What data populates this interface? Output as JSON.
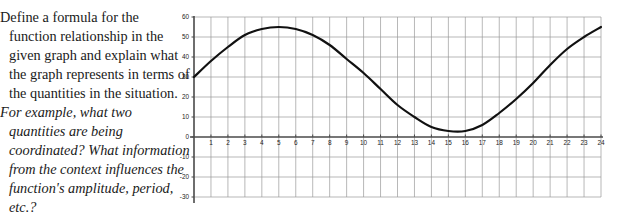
{
  "prompt": {
    "roman_text": "Define a formula for the function relationship in the given graph and explain what the graph represents in terms of the quantities in the situation.",
    "italic_text": "For example, what two quantities are being coordinated? What information from the context influences the function's amplitude, period, etc.?"
  },
  "chart_data": {
    "type": "line",
    "title": "",
    "xlabel": "",
    "ylabel": "",
    "xlim": [
      0,
      24
    ],
    "ylim": [
      -30,
      60
    ],
    "grid": true,
    "legend": "none",
    "x_ticks": [
      "1",
      "2",
      "3",
      "4",
      "5",
      "6",
      "7",
      "8",
      "9",
      "10",
      "11",
      "12",
      "13",
      "14",
      "15",
      "16",
      "17",
      "18",
      "19",
      "20",
      "21",
      "22",
      "23",
      "24"
    ],
    "y_ticks": [
      "60",
      "50",
      "40",
      "30",
      "20",
      "10",
      "0",
      "-10",
      "-20",
      "-30"
    ],
    "series": [
      {
        "name": "sinusoid",
        "color": "#111111",
        "description": "Sinusoidal curve, midline 29, amplitude 26, period 20, starts at 30 rising, maximum 55 near x=5, minimum 3 near x=15, rising to 55 at x=24",
        "x": [
          0,
          1,
          2,
          3,
          4,
          5,
          6,
          7,
          8,
          9,
          10,
          11,
          12,
          13,
          14,
          15,
          16,
          17,
          18,
          19,
          20,
          21,
          22,
          23,
          24
        ],
        "y": [
          30,
          38,
          45,
          51,
          54,
          55,
          54,
          51,
          46,
          39,
          32,
          24,
          16,
          10,
          5,
          3,
          3,
          6,
          12,
          19,
          27,
          36,
          44,
          50,
          55
        ]
      }
    ],
    "axis_zero_line": 0
  }
}
